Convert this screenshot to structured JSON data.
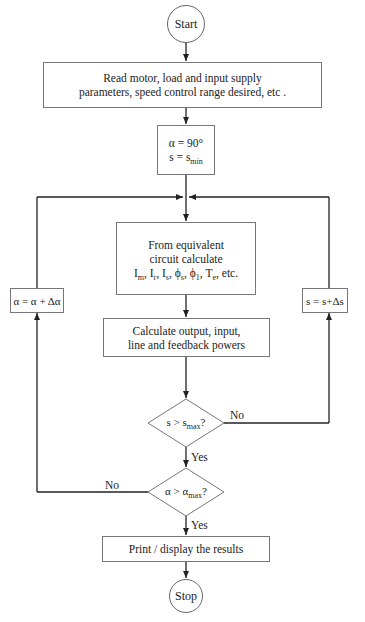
{
  "flowchart": {
    "start": "Start",
    "read_params": {
      "line1": "Read motor, load and input supply",
      "line2": "parameters, speed control range desired, etc ."
    },
    "init": {
      "alpha_line": "α = 90°",
      "s_prefix": "s = s",
      "s_sub": "min"
    },
    "equiv_circuit": {
      "line1": "From equivalent",
      "line2": "circuit calculate",
      "line3": "Im, Ir, Is, ϕs, ϕ1, Te, etc.",
      "vars": [
        {
          "base": "I",
          "sub": "m"
        },
        {
          "base": "I",
          "sub": "r"
        },
        {
          "base": "I",
          "sub": "s"
        },
        {
          "base": "ϕ",
          "sub": "s"
        },
        {
          "base": "ϕ",
          "sub": "1"
        },
        {
          "base": "T",
          "sub": "e"
        }
      ],
      "tail": "etc."
    },
    "calc_powers": {
      "line1": "Calculate output, input,",
      "line2": "line and feedback powers"
    },
    "decision_s": {
      "prefix": "s > s",
      "sub": "max",
      "suffix": "?",
      "no_label": "No",
      "yes_label": "Yes"
    },
    "decision_alpha": {
      "prefix": "α > α",
      "sub": "max",
      "suffix": "?",
      "no_label": "No",
      "yes_label": "Yes"
    },
    "increment_alpha": "α = α + Δα",
    "increment_s": "s = s+Δs",
    "print_results": "Print / display the results",
    "stop": "Stop"
  },
  "colors": {
    "line": "#222222",
    "border": "#777777",
    "background": "#ffffff"
  }
}
